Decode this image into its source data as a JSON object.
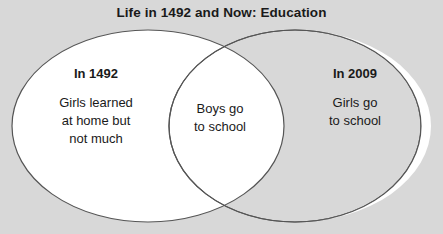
{
  "diagram": {
    "type": "venn",
    "title": "Life in 1492 and Now: Education",
    "background_color": "#d8d8d8",
    "circle_fill": "#ffffff",
    "circle_stroke": "#555555",
    "text_color": "#1a1a1a",
    "sets": [
      {
        "id": "left",
        "heading": "In 1492",
        "lines": [
          "Girls learned",
          "at home but",
          "not much"
        ]
      },
      {
        "id": "right",
        "heading": "In 2009",
        "lines": [
          "Girls go",
          "to school"
        ]
      }
    ],
    "intersection": {
      "id": "center",
      "heading": "",
      "lines": [
        "Boys go",
        "to school"
      ]
    }
  }
}
